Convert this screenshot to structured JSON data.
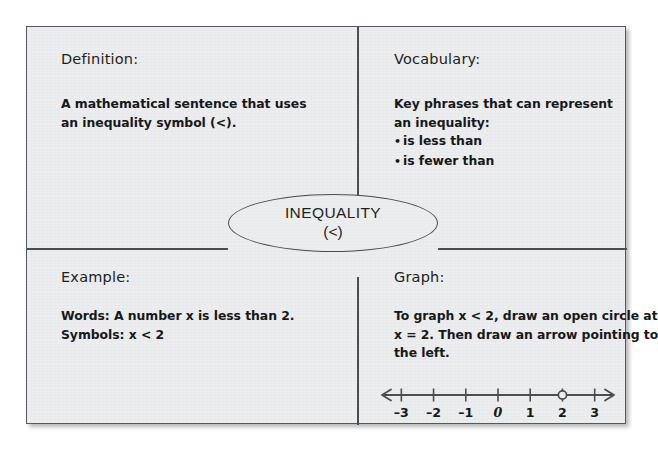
{
  "card": {
    "title": "Frayer model graphic organizer",
    "border_color": "#55585c",
    "background_color": "#ecedee"
  },
  "center": {
    "term": "INEQUALITY",
    "symbol": "(<)"
  },
  "quadrants": {
    "definition": {
      "heading": "Definition:",
      "lines": [
        "A mathematical sentence that uses",
        "an inequality symbol (<)."
      ]
    },
    "vocabulary": {
      "heading": "Vocabulary:",
      "lines": [
        "Key phrases that can represent",
        "an inequality:"
      ],
      "bullet_glyph": "•",
      "bullets": [
        "is less than",
        "is fewer than"
      ]
    },
    "example": {
      "heading": "Example:",
      "lines": [
        "Words: A number x is less than 2.",
        "Symbols: x < 2"
      ]
    },
    "graph": {
      "heading": "Graph:",
      "lines": [
        "To graph x < 2, draw an open circle at",
        "x = 2.  Then draw an arrow pointing to",
        "the left."
      ]
    }
  },
  "chart_data": {
    "type": "number-line",
    "xlabel": "",
    "ylabel": "",
    "xlim": [
      -3.6,
      3.6
    ],
    "grid": false,
    "tick_values": [
      -3,
      -2,
      -1,
      0,
      1,
      2,
      3
    ],
    "tick_labels": [
      "–3",
      "–2",
      "–1",
      "0",
      "1",
      "2",
      "3"
    ],
    "arrows": {
      "left": true,
      "right": true
    },
    "points": [
      {
        "value": 2,
        "style": "open-circle",
        "label": "2",
        "meaning": "endpoint not included"
      }
    ],
    "line_color": "#4a4d51",
    "point_fill": "#ecedee"
  }
}
